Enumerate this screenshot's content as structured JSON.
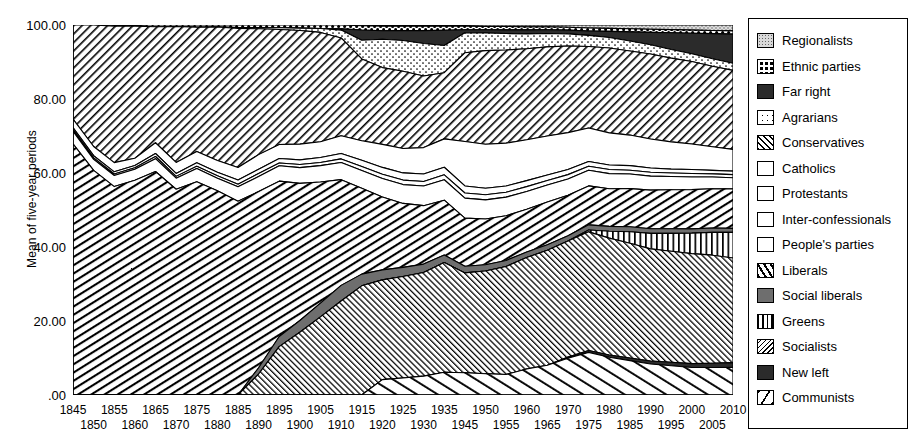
{
  "chart_data": {
    "type": "area",
    "title": "",
    "xlabel": "",
    "ylabel": "Mean of five-year periods",
    "ylim": [
      0,
      100
    ],
    "yticks": [
      "100.00",
      "80.00",
      "60.00",
      "40.00",
      "20.00",
      ".00"
    ],
    "ytick_values": [
      100,
      80,
      60,
      40,
      20,
      0
    ],
    "grid": false,
    "legend_position": "right",
    "stacked": true,
    "stack_order": "top-to-bottom",
    "note": "Stacked area of party-family vote shares, 1845-2010; the 1940 period is absent (war gap).",
    "x": [
      1845,
      1850,
      1855,
      1860,
      1865,
      1870,
      1875,
      1880,
      1885,
      1890,
      1895,
      1900,
      1905,
      1910,
      1915,
      1920,
      1925,
      1930,
      1935,
      1945,
      1950,
      1955,
      1960,
      1965,
      1970,
      1975,
      1980,
      1985,
      1990,
      1995,
      2000,
      2005,
      2010
    ],
    "xtick_labels_top": [
      "1845",
      "1855",
      "1865",
      "1875",
      "1885",
      "1895",
      "1905",
      "1915",
      "1925",
      "1935",
      "1950",
      "1960",
      "1970",
      "1980",
      "1990",
      "2000",
      "2010"
    ],
    "xtick_labels_bottom": [
      "1850",
      "1860",
      "1870",
      "1880",
      "1890",
      "1900",
      "1910",
      "1920",
      "1930",
      "1945",
      "1955",
      "1965",
      "1975",
      "1985",
      "1995",
      "2005"
    ],
    "series": [
      {
        "name": "Regionalists",
        "pattern": "stipple",
        "values": [
          0,
          0,
          0,
          0,
          0,
          0,
          0,
          0,
          0,
          0,
          0,
          0,
          0,
          0,
          0.2,
          0.3,
          0.3,
          0.3,
          0.3,
          0.3,
          0.4,
          0.4,
          0.5,
          0.5,
          0.6,
          0.8,
          0.9,
          1.0,
          1.1,
          1.2,
          1.3,
          1.4,
          1.5
        ]
      },
      {
        "name": "Ethnic parties",
        "pattern": "checkered",
        "values": [
          0,
          0,
          0.3,
          0.3,
          0.4,
          0.4,
          0.5,
          0.5,
          0.6,
          0.6,
          0.7,
          0.8,
          0.9,
          1.0,
          1.1,
          1.2,
          1.2,
          1.2,
          1.1,
          1.0,
          0.9,
          0.9,
          0.8,
          0.8,
          0.8,
          0.8,
          0.8,
          0.8,
          0.8,
          0.8,
          0.8,
          0.8,
          0.8
        ]
      },
      {
        "name": "Far right",
        "pattern": "solid-black",
        "values": [
          0,
          0,
          0,
          0,
          0,
          0,
          0,
          0,
          0,
          0,
          0,
          0,
          0,
          0.3,
          2.6,
          2.2,
          2.6,
          3.4,
          4.0,
          0.8,
          0.9,
          1.0,
          1.1,
          1.0,
          1.0,
          1.2,
          1.6,
          2.4,
          3.2,
          4.3,
          5.2,
          6.4,
          7.4
        ]
      },
      {
        "name": "Agrarians",
        "pattern": "sparse-dots",
        "values": [
          0,
          0,
          0,
          0,
          0,
          0,
          0,
          0,
          0.2,
          0.3,
          0.4,
          0.6,
          1.0,
          2.0,
          4.8,
          7.4,
          8.2,
          8.6,
          7.2,
          5.4,
          4.8,
          4.4,
          4.0,
          3.6,
          3.3,
          3.0,
          2.8,
          2.6,
          2.4,
          2.2,
          2.0,
          1.9,
          1.8
        ]
      },
      {
        "name": "Conservatives",
        "pattern": "diagonal-hatch",
        "values": [
          22.5,
          33.0,
          37.0,
          36.0,
          27.0,
          37.0,
          28.0,
          34.0,
          33.0,
          30.0,
          28.5,
          29.0,
          28.0,
          25.0,
          21.0,
          20.0,
          20.5,
          19.0,
          17.5,
          24.0,
          25.5,
          25.0,
          24.5,
          24.0,
          23.5,
          22.0,
          22.5,
          22.0,
          22.0,
          21.5,
          21.0,
          20.5,
          20.0
        ]
      },
      {
        "name": "Catholics",
        "pattern": "white",
        "values": [
          2.0,
          2.5,
          2.5,
          2.0,
          2.5,
          3.0,
          2.5,
          3.0,
          3.0,
          3.5,
          3.5,
          4.0,
          4.0,
          4.5,
          5.0,
          6.0,
          6.5,
          7.0,
          7.5,
          12.0,
          12.0,
          11.5,
          11.0,
          10.5,
          10.0,
          9.0,
          8.5,
          8.0,
          7.5,
          7.0,
          6.5,
          6.0,
          5.5
        ]
      },
      {
        "name": "Protestants",
        "pattern": "white",
        "values": [
          0.5,
          0.6,
          0.6,
          0.6,
          0.7,
          0.8,
          0.8,
          0.9,
          1.0,
          1.0,
          1.1,
          1.2,
          1.3,
          1.4,
          1.6,
          1.8,
          1.9,
          2.0,
          2.0,
          1.9,
          1.8,
          1.7,
          1.6,
          1.5,
          1.4,
          1.3,
          1.2,
          1.2,
          1.1,
          1.0,
          1.0,
          0.9,
          0.9
        ]
      },
      {
        "name": "Inter-confessionals",
        "pattern": "white",
        "values": [
          0.4,
          0.4,
          0.4,
          0.4,
          0.5,
          0.5,
          0.5,
          0.6,
          0.6,
          0.7,
          0.7,
          0.8,
          0.8,
          0.9,
          1.0,
          1.1,
          1.2,
          1.2,
          1.3,
          1.4,
          1.4,
          1.3,
          1.3,
          1.2,
          1.2,
          1.1,
          1.1,
          1.0,
          1.0,
          0.9,
          0.9,
          0.8,
          0.8
        ]
      },
      {
        "name": "People's parties",
        "pattern": "white",
        "values": [
          3.0,
          3.0,
          3.0,
          3.0,
          3.0,
          3.0,
          3.0,
          3.2,
          3.4,
          3.6,
          3.8,
          4.0,
          4.2,
          4.4,
          4.6,
          4.8,
          5.0,
          5.2,
          5.4,
          5.4,
          5.2,
          5.0,
          4.8,
          4.6,
          4.4,
          4.2,
          4.0,
          3.8,
          3.6,
          3.4,
          3.2,
          3.0,
          2.8
        ]
      },
      {
        "name": "Liberals",
        "pattern": "steep-hatch",
        "values": [
          60.0,
          61.0,
          56.5,
          58.5,
          52.0,
          56.0,
          48.0,
          52.0,
          46.0,
          42.0,
          38.5,
          35.0,
          31.0,
          27.0,
          22.0,
          19.0,
          17.0,
          15.5,
          14.5,
          13.0,
          12.5,
          12.0,
          11.5,
          11.5,
          11.0,
          10.5,
          10.0,
          10.0,
          10.0,
          10.0,
          10.0,
          10.0,
          10.0
        ]
      },
      {
        "name": "Social liberals",
        "pattern": "solid-gray",
        "values": [
          0,
          0,
          0,
          0,
          0,
          0,
          0,
          0,
          0,
          1.5,
          2.5,
          3.0,
          3.5,
          4.0,
          3.0,
          2.6,
          2.4,
          2.2,
          2.0,
          1.8,
          1.7,
          1.6,
          1.5,
          1.5,
          1.4,
          1.4,
          1.3,
          1.3,
          1.2,
          1.2,
          1.1,
          1.1,
          1.0
        ]
      },
      {
        "name": "Greens",
        "pattern": "vertical-stripes",
        "values": [
          0,
          0,
          0,
          0,
          0,
          0,
          0,
          0,
          0,
          0,
          0,
          0,
          0,
          0,
          0,
          0,
          0,
          0,
          0,
          0,
          0,
          0,
          0,
          0,
          0,
          0.5,
          1.8,
          3.0,
          4.0,
          4.6,
          5.2,
          5.8,
          6.5
        ]
      },
      {
        "name": "Socialists",
        "pattern": "fine-back-hatch",
        "values": [
          0,
          0,
          0,
          0,
          0,
          0,
          0,
          0,
          0,
          5.0,
          12.0,
          16.0,
          20.0,
          24.0,
          28.0,
          26.0,
          27.0,
          27.5,
          29.0,
          27.0,
          28.0,
          29.0,
          30.0,
          31.0,
          31.5,
          32.0,
          31.0,
          30.0,
          29.0,
          28.5,
          28.0,
          27.5,
          26.5
        ]
      },
      {
        "name": "New left",
        "pattern": "solid-black",
        "values": [
          0,
          0,
          0,
          0,
          0,
          0,
          0,
          0,
          0,
          0,
          0,
          0,
          0,
          0,
          0,
          0,
          0,
          0,
          0,
          0,
          0,
          0,
          0,
          0,
          0.3,
          0.5,
          0.6,
          0.7,
          0.8,
          0.9,
          1.0,
          1.1,
          1.2
        ]
      },
      {
        "name": "Communists",
        "pattern": "sparse-back-hatch",
        "values": [
          0,
          0,
          0,
          0,
          0,
          0,
          0,
          0,
          0,
          0,
          0,
          0,
          0,
          0,
          0,
          4.0,
          4.5,
          5.0,
          6.0,
          6.0,
          5.8,
          5.5,
          7.0,
          8.0,
          10.0,
          11.5,
          10.0,
          9.0,
          8.0,
          7.5,
          7.0,
          7.0,
          7.0
        ]
      }
    ]
  },
  "legend": {
    "items": [
      {
        "label": "Regionalists",
        "swatch": "sw-stipple",
        "icon": "legend-swatch-regionalists"
      },
      {
        "label": "Ethnic parties",
        "swatch": "sw-check",
        "icon": "legend-swatch-ethnic-parties"
      },
      {
        "label": "Far right",
        "swatch": "sw-solidblack",
        "icon": "legend-swatch-far-right"
      },
      {
        "label": "Agrarians",
        "swatch": "sw-dots",
        "icon": "legend-swatch-agrarians"
      },
      {
        "label": "Conservatives",
        "swatch": "sw-hatch",
        "icon": "legend-swatch-conservatives"
      },
      {
        "label": "Catholics",
        "swatch": "sw-white",
        "icon": "legend-swatch-catholics"
      },
      {
        "label": "Protestants",
        "swatch": "sw-white",
        "icon": "legend-swatch-protestants"
      },
      {
        "label": "Inter-confessionals",
        "swatch": "sw-white",
        "icon": "legend-swatch-inter-confessionals"
      },
      {
        "label": "People's parties",
        "swatch": "sw-white",
        "icon": "legend-swatch-peoples-parties"
      },
      {
        "label": "Liberals",
        "swatch": "sw-libhatch",
        "icon": "legend-swatch-liberals"
      },
      {
        "label": "Social liberals",
        "swatch": "sw-gray",
        "icon": "legend-swatch-social-liberals"
      },
      {
        "label": "Greens",
        "swatch": "sw-vert",
        "icon": "legend-swatch-greens"
      },
      {
        "label": "Socialists",
        "swatch": "sw-sochatch",
        "icon": "legend-swatch-socialists"
      },
      {
        "label": "New left",
        "swatch": "sw-solidblack",
        "icon": "legend-swatch-new-left"
      },
      {
        "label": "Communists",
        "swatch": "sw-comm",
        "icon": "legend-swatch-communists"
      }
    ]
  }
}
